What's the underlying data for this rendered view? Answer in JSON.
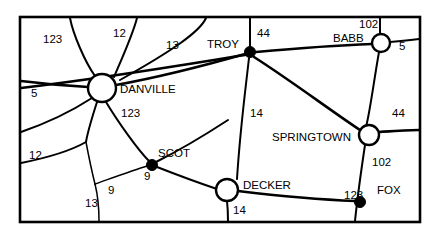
{
  "map": {
    "title": "Road map with towns and numbered routes",
    "background_color": "#ffffff",
    "line_color": "#000000",
    "frame": {
      "x": 20,
      "y": 17,
      "width": 400,
      "height": 205
    },
    "cities": [
      {
        "name": "DANVILLE",
        "type": "open-circle",
        "cx": 102,
        "cy": 88,
        "r": 14,
        "label_x": 120,
        "label_y": 93
      },
      {
        "name": "TROY",
        "type": "filled-dot",
        "cx": 250,
        "cy": 52,
        "r": 5.5,
        "label_x": 207,
        "label_y": 48
      },
      {
        "name": "BABB",
        "type": "open-circle",
        "cx": 381,
        "cy": 43,
        "r": 9,
        "label_x": 333,
        "label_y": 42
      },
      {
        "name": "SPRINGTOWN",
        "type": "open-circle",
        "cx": 369,
        "cy": 135,
        "r": 10,
        "label_x": 272,
        "label_y": 141
      },
      {
        "name": "SCOT",
        "type": "filled-dot",
        "cx": 152,
        "cy": 165,
        "r": 5.5,
        "label_x": 158,
        "label_y": 157
      },
      {
        "name": "DECKER",
        "type": "open-circle",
        "cx": 227,
        "cy": 190,
        "r": 11,
        "label_x": 243,
        "label_y": 189
      },
      {
        "name": "FOX",
        "type": "filled-dot",
        "cx": 360,
        "cy": 202,
        "r": 5.5,
        "label_x": 377,
        "label_y": 194
      }
    ],
    "route_labels": [
      {
        "number": "123",
        "x": 43,
        "y": 43
      },
      {
        "number": "12",
        "x": 113,
        "y": 37
      },
      {
        "number": "13",
        "x": 166,
        "y": 49
      },
      {
        "number": "44",
        "x": 257,
        "y": 37
      },
      {
        "number": "102",
        "x": 359,
        "y": 28
      },
      {
        "number": "5",
        "x": 399,
        "y": 50
      },
      {
        "number": "5",
        "x": 31,
        "y": 97
      },
      {
        "number": "123",
        "x": 121,
        "y": 117
      },
      {
        "number": "14",
        "x": 250,
        "y": 117
      },
      {
        "number": "44",
        "x": 392,
        "y": 117
      },
      {
        "number": "12",
        "x": 29,
        "y": 159
      },
      {
        "number": "102",
        "x": 372,
        "y": 166
      },
      {
        "number": "9",
        "x": 144,
        "y": 180
      },
      {
        "number": "9",
        "x": 108,
        "y": 194
      },
      {
        "number": "13",
        "x": 85,
        "y": 207
      },
      {
        "number": "14",
        "x": 233,
        "y": 214
      },
      {
        "number": "123",
        "x": 344,
        "y": 199
      }
    ],
    "roads": [
      {
        "id": "road-123-northwest",
        "route": "123",
        "d": "M 70 18 C 73 34, 85 62, 95 76",
        "weight": "mid"
      },
      {
        "id": "road-12-north",
        "route": "12",
        "d": "M 137 18 C 133 34, 123 56, 114 77",
        "weight": "mid"
      },
      {
        "id": "road-13-northeast",
        "route": "13",
        "d": "M 206 18 C 200 32, 170 52, 120 80",
        "weight": "mid"
      },
      {
        "id": "road-5-west-danville",
        "route": "5",
        "d": "M 21 81 C 45 84, 70 86, 88 87",
        "weight": "major"
      },
      {
        "id": "road-danville-troy",
        "route": "13",
        "d": "M 116 85 C 160 77, 210 64, 245 54",
        "weight": "major"
      },
      {
        "id": "road-danville-southwest",
        "route": "12",
        "d": "M 92 98 C 75 109, 50 122, 21 132",
        "weight": "mid"
      },
      {
        "id": "road-danville-scot",
        "route": "123",
        "d": "M 106 102 C 118 122, 138 150, 149 161",
        "weight": "mid"
      },
      {
        "id": "road-danville-south",
        "route": "12",
        "d": "M 97 102 C 92 118, 88 130, 86 142",
        "weight": "mid"
      },
      {
        "id": "road-12-southwest-branch",
        "route": "12",
        "d": "M 86 142 C 72 150, 46 158, 21 163",
        "weight": "mid"
      },
      {
        "id": "road-13-south-branch",
        "route": "13",
        "d": "M 86 142 C 89 158, 92 172, 95 184",
        "weight": "minor"
      },
      {
        "id": "road-13-to-bottom",
        "route": "13",
        "d": "M 95 184 C 98 196, 99 208, 99 221",
        "weight": "minor"
      },
      {
        "id": "road-9-west-scot",
        "route": "9",
        "d": "M 95 184 C 112 178, 134 170, 147 166",
        "weight": "minor"
      },
      {
        "id": "road-scot-decker",
        "route": "9",
        "d": "M 157 167 C 180 176, 205 185, 217 189",
        "weight": "mid"
      },
      {
        "id": "road-scot-southeast",
        "route": "9",
        "d": "M 156 162 C 180 150, 205 135, 228 120",
        "weight": "mid"
      },
      {
        "id": "road-troy-44-north",
        "route": "44",
        "d": "M 250 47 C 250 38, 250 28, 250 18",
        "weight": "mid"
      },
      {
        "id": "road-troy-west-edge",
        "route": "13",
        "d": "M 245 55 C 200 62, 120 76, 21 88",
        "weight": "major"
      },
      {
        "id": "road-troy-babb",
        "route": "102",
        "d": "M 256 52 C 300 48, 345 45, 372 44",
        "weight": "major"
      },
      {
        "id": "road-troy-14-south",
        "route": "14",
        "d": "M 249 58 C 246 85, 240 130, 237 179",
        "weight": "mid"
      },
      {
        "id": "road-troy-springtown",
        "route": "14",
        "d": "M 254 57 C 290 80, 330 110, 360 130",
        "weight": "major"
      },
      {
        "id": "road-babb-102-north",
        "route": "102",
        "d": "M 380 34 C 380 28, 380 22, 380 18",
        "weight": "mid"
      },
      {
        "id": "road-babb-5-east",
        "route": "5",
        "d": "M 390 42 C 403 41, 412 40, 419 39",
        "weight": "mid"
      },
      {
        "id": "road-babb-springtown",
        "route": "44",
        "d": "M 379 52 C 374 80, 370 112, 366 127",
        "weight": "mid"
      },
      {
        "id": "road-springtown-44-east",
        "route": "44",
        "d": "M 379 132 C 396 131, 410 130, 419 130",
        "weight": "major"
      },
      {
        "id": "road-springtown-102-south",
        "route": "102",
        "d": "M 365 145 C 362 165, 358 192, 355 221",
        "weight": "mid"
      },
      {
        "id": "road-decker-123-fox",
        "route": "123",
        "d": "M 238 191 C 280 196, 330 200, 355 201",
        "weight": "major"
      },
      {
        "id": "road-decker-14-south",
        "route": "14",
        "d": "M 227 201 C 228 210, 228 216, 228 221",
        "weight": "mid"
      }
    ]
  }
}
